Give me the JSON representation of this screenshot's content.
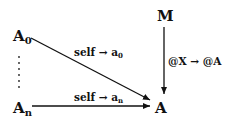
{
  "diagram": {
    "nodes": {
      "M": {
        "label": "M"
      },
      "A0": {
        "label": "A",
        "sub": "0"
      },
      "An": {
        "label": "A",
        "sub": "n"
      },
      "A": {
        "label": "A"
      }
    },
    "dots": "⋮",
    "edges": [
      {
        "from": "A0",
        "to": "A",
        "label_main": "self → a",
        "label_sub": "0"
      },
      {
        "from": "An",
        "to": "A",
        "label_main": "self → a",
        "label_sub": "n"
      },
      {
        "from": "M",
        "to": "A",
        "label_main": "@X → @A"
      }
    ]
  }
}
